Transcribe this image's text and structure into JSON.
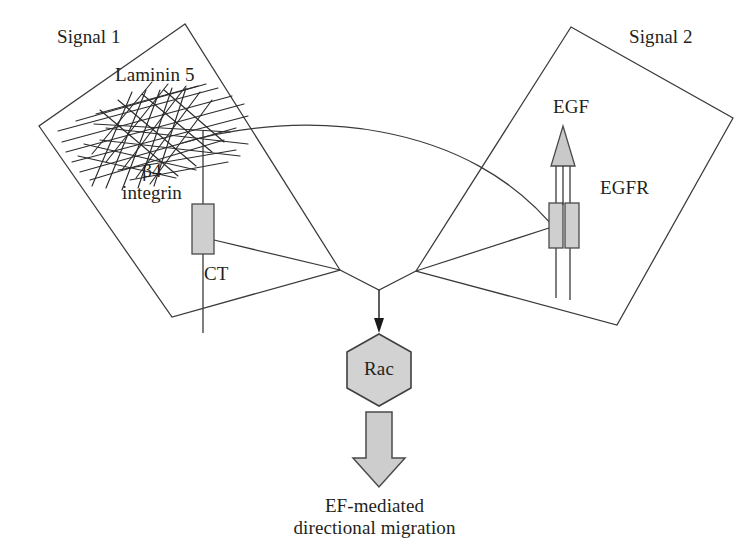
{
  "figure": {
    "background_color": "#ffffff",
    "line_color": "#3a3a3a",
    "fill_gray": "#cfcfcf",
    "text_color": "#231f20"
  },
  "panels": {
    "left": {
      "name": "Signal 1",
      "label": "Signal 1",
      "contents": [
        "Laminin 5",
        "β4 integrin",
        "CT"
      ]
    },
    "right": {
      "name": "Signal 2",
      "label": "Signal 2",
      "contents": [
        "EGF",
        "EGFR"
      ]
    }
  },
  "labels": {
    "signal1": "Signal 1",
    "laminin5": "Laminin 5",
    "beta4_line1": "β4",
    "beta4_line2": "integrin",
    "ct": "CT",
    "signal2": "Signal 2",
    "egf": "EGF",
    "egfr": "EGFR",
    "rac": "Rac"
  },
  "caption": {
    "line1": "EF-mediated",
    "line2": "directional migration"
  },
  "nodes": {
    "rac": {
      "label": "Rac",
      "shape": "hexagon",
      "fill": "#d2d2d2",
      "stroke": "#404040"
    }
  },
  "arrows": {
    "to_rac": {
      "name": "convergence-arrow",
      "style": "thin-solid-head",
      "direction": "down"
    },
    "outcome": {
      "name": "outcome-block-arrow",
      "style": "gray-block",
      "direction": "down",
      "fill": "#cdcdcd"
    },
    "egf": {
      "name": "egf-arrow",
      "style": "gray-triangle-head",
      "direction": "up",
      "fill": "#c9c9c9"
    }
  },
  "receptors": {
    "beta4_integrin": {
      "label": "β4 integrin",
      "tail_label": "CT",
      "subunits": 1,
      "fill": "#cfcfcf"
    },
    "egfr": {
      "label": "EGFR",
      "subunits": 2,
      "fill": "#cfcfcf"
    }
  },
  "matrix": {
    "laminin5": {
      "label": "Laminin 5",
      "representation": "crossed-fiber-mesh"
    }
  }
}
